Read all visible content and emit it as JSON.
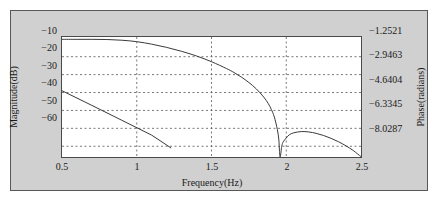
{
  "figure": {
    "background_color": "#d0d0d0",
    "plot_background_color": "#ffffff",
    "frame_color": "#585858",
    "curve_color": "#3a3a3a",
    "grid_color": "#555555"
  },
  "axes": {
    "x_title": "Frequency(Hz)",
    "y_left_title": "Magnitude(dB)",
    "y_right_title": "Phase(radians)",
    "x_ticks": [
      "0.5",
      "1",
      "1.5",
      "2",
      "2.5"
    ],
    "y_left_ticks": [
      "−10",
      "−20",
      "−30",
      "−40",
      "−50",
      "−60"
    ],
    "y_right_ticks": [
      "−1.2521",
      "−2.9463",
      "−4.6404",
      "−6.3345",
      "−8.0287"
    ]
  },
  "chart_data": {
    "type": "line",
    "title": "",
    "xlabel": "Frequency(Hz)",
    "ylabel": "Magnitude(dB)",
    "y2label": "Phase(radians)",
    "xlim": [
      0.5,
      2.5
    ],
    "ylim": [
      -66,
      1
    ],
    "y2lim": [
      -8.8745,
      -0.405
    ],
    "grid": true,
    "legend": null,
    "xticks": [
      0.5,
      1,
      1.5,
      2,
      2.5
    ],
    "yticks": [
      -10,
      -20,
      -30,
      -40,
      -50,
      -60
    ],
    "y2ticks": [
      -1.2521,
      -2.9463,
      -4.6404,
      -6.3345,
      -8.0287
    ],
    "series": [
      {
        "name": "Magnitude",
        "axis": "left",
        "units": "dB",
        "x": [
          0.5,
          0.6,
          0.7,
          0.8,
          0.9,
          1.0,
          1.1,
          1.2,
          1.3,
          1.4,
          1.5,
          1.6,
          1.65,
          1.7,
          1.75,
          1.8,
          1.85,
          1.88,
          1.9,
          1.92,
          1.94,
          1.95,
          1.955,
          1.96,
          1.97,
          1.98,
          2.0,
          2.02,
          2.05,
          2.1,
          2.15,
          2.2,
          2.25,
          2.3,
          2.35,
          2.4,
          2.45,
          2.5
        ],
        "y": [
          -0.3,
          -0.3,
          -0.3,
          -0.4,
          -0.8,
          -1.6,
          -3.0,
          -4.8,
          -7.0,
          -9.6,
          -12.8,
          -16.6,
          -18.8,
          -21.4,
          -24.4,
          -28.0,
          -32.6,
          -36.2,
          -39.4,
          -43.6,
          -50.5,
          -56.0,
          -63.0,
          -66.0,
          -60.0,
          -57.5,
          -55.4,
          -53.6,
          -52.5,
          -51.8,
          -52.0,
          -52.8,
          -54.0,
          -55.6,
          -57.5,
          -59.8,
          -62.5,
          -65.8
        ]
      },
      {
        "name": "Phase",
        "axis": "right",
        "units": "radians",
        "x": [
          0.5,
          0.7,
          0.9,
          1.1,
          1.23
        ],
        "y": [
          -29.0,
          -37.2,
          -45.5,
          -53.8,
          -61.0
        ],
        "y_right": [
          -4.47,
          -5.29,
          -6.11,
          -6.94,
          -7.66
        ]
      }
    ]
  }
}
